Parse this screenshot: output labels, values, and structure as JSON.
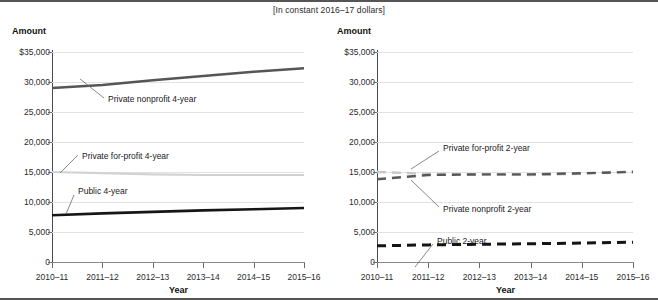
{
  "subtitle": "[In constant 2016–17 dollars]",
  "panels": [
    {
      "id": "four-year",
      "amount_label": "Amount",
      "xaxis_title": "Year",
      "ytick_labels": [
        "$35,000",
        "30,000",
        "25,000",
        "20,000",
        "15,000",
        "10,000",
        "5,000",
        "0"
      ],
      "xtick_labels": [
        "2010–11",
        "2011–12",
        "2012–13",
        "2013–14",
        "2014–15",
        "2015–16"
      ],
      "annotations": [
        {
          "name": "private-nonprofit-4-year",
          "text": "Private nonprofit 4-year"
        },
        {
          "name": "private-for-profit-4-year",
          "text": "Private for-profit 4-year"
        },
        {
          "name": "public-4-year",
          "text": "Public 4-year"
        }
      ]
    },
    {
      "id": "two-year",
      "amount_label": "Amount",
      "xaxis_title": "Year",
      "ytick_labels": [
        "$35,000",
        "30,000",
        "25,000",
        "20,000",
        "15,000",
        "10,000",
        "5,000",
        "0"
      ],
      "xtick_labels": [
        "2010–11",
        "2011–12",
        "2012–13",
        "2013–14",
        "2014–15",
        "2015–16"
      ],
      "annotations": [
        {
          "name": "private-for-profit-2-year",
          "text": "Private for-profit 2-year"
        },
        {
          "name": "private-nonprofit-2-year",
          "text": "Private nonprofit 2-year"
        },
        {
          "name": "public-2-year",
          "text": "Public 2-year"
        }
      ]
    }
  ],
  "chart_data": [
    {
      "type": "line",
      "title": "",
      "subtitle": "[In constant 2016–17 dollars]",
      "xlabel": "Year",
      "ylabel": "Amount",
      "ylim": [
        0,
        35000
      ],
      "yticks": [
        0,
        5000,
        10000,
        15000,
        20000,
        25000,
        30000,
        35000
      ],
      "ytick_labels": [
        "0",
        "5,000",
        "10,000",
        "15,000",
        "20,000",
        "25,000",
        "30,000",
        "$35,000"
      ],
      "categories": [
        "2010–11",
        "2011–12",
        "2012–13",
        "2013–14",
        "2014–15",
        "2015–16"
      ],
      "grid": true,
      "legend": "inline-annotations",
      "series": [
        {
          "name": "Private nonprofit 4-year",
          "values": [
            29000,
            29500,
            30300,
            31000,
            31700,
            32300
          ],
          "color": "#565656",
          "style": "solid",
          "width": 2.4
        },
        {
          "name": "Private for-profit 4-year",
          "values": [
            15000,
            14800,
            14600,
            14500,
            14500,
            14500
          ],
          "color": "#d2d2d2",
          "style": "solid",
          "width": 2.2
        },
        {
          "name": "Public 4-year",
          "values": [
            7800,
            8100,
            8350,
            8600,
            8800,
            9000
          ],
          "color": "#161616",
          "style": "solid",
          "width": 2.6
        }
      ]
    },
    {
      "type": "line",
      "title": "",
      "subtitle": "[In constant 2016–17 dollars]",
      "xlabel": "Year",
      "ylabel": "Amount",
      "ylim": [
        0,
        35000
      ],
      "yticks": [
        0,
        5000,
        10000,
        15000,
        20000,
        25000,
        30000,
        35000
      ],
      "ytick_labels": [
        "0",
        "5,000",
        "10,000",
        "15,000",
        "20,000",
        "25,000",
        "30,000",
        "$35,000"
      ],
      "categories": [
        "2010–11",
        "2011–12",
        "2012–13",
        "2013–14",
        "2014–15",
        "2015–16"
      ],
      "grid": true,
      "legend": "inline-annotations",
      "series": [
        {
          "name": "Private for-profit 2-year",
          "values": [
            15000,
            14700,
            14600,
            14500,
            14700,
            15100
          ],
          "color": "#c8c8c8",
          "style": "dashed",
          "width": 2.4
        },
        {
          "name": "Private nonprofit 2-year",
          "values": [
            13800,
            14500,
            14600,
            14600,
            14800,
            15000
          ],
          "color": "#585858",
          "style": "dashed",
          "width": 2.4
        },
        {
          "name": "Public 2-year",
          "values": [
            2700,
            2850,
            2950,
            3050,
            3150,
            3300
          ],
          "color": "#141414",
          "style": "dashed",
          "width": 3.0
        }
      ]
    }
  ]
}
